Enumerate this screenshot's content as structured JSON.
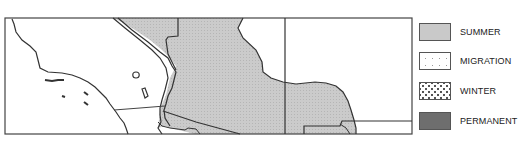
{
  "legend": {
    "items": [
      {
        "label": "SUMMER",
        "color": "#c9c9c9",
        "pattern": "solid-light-gray"
      },
      {
        "label": "MIGRATION",
        "color": "#ffffff",
        "pattern": "sparse-dots"
      },
      {
        "label": "WINTER",
        "color": "#ffffff",
        "pattern": "dense-dots"
      },
      {
        "label": "PERMANENT",
        "color": "#6e6e6e",
        "pattern": "solid-dark-gray"
      }
    ]
  },
  "map": {
    "region": "Southwestern North America (California / Baja / Mexico border)",
    "summer_fill": "#c9c9c9",
    "outline": "#333333"
  }
}
